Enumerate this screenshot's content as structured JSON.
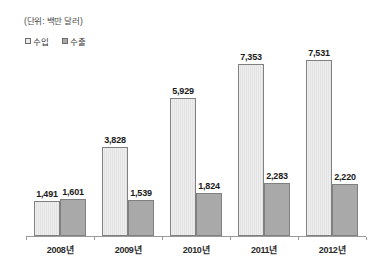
{
  "chart_data": {
    "type": "bar",
    "title": "",
    "subtitle": "",
    "unit_note": "(단위: 백만 달러)",
    "categories": [
      "2008년",
      "2009년",
      "2010년",
      "2011년",
      "2012년"
    ],
    "series": [
      {
        "name": "수입",
        "values": [
          1491,
          3828,
          5929,
          7353,
          7531
        ],
        "labels": [
          "1,491",
          "3,828",
          "5,929",
          "7,353",
          "7,531"
        ],
        "color": "#ececec"
      },
      {
        "name": "수출",
        "values": [
          1601,
          1539,
          1824,
          2283,
          2220
        ],
        "labels": [
          "1,601",
          "1,539",
          "1,824",
          "2,283",
          "2,220"
        ],
        "color": "#a9a9a9"
      }
    ],
    "xlabel": "",
    "ylabel": "",
    "ylim": [
      0,
      8400
    ],
    "grid": false,
    "legend_position": "top-left",
    "axis_color": "#9a9a9a"
  }
}
